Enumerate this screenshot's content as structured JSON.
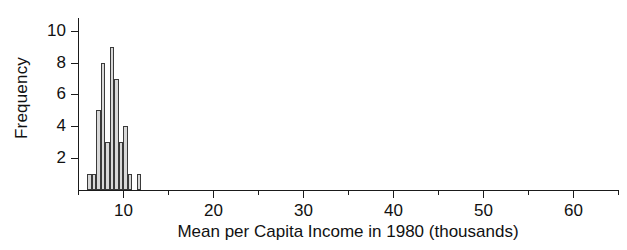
{
  "chart_data": {
    "type": "bar",
    "title": "",
    "xlabel": "Mean per Capita Income in 1980 (thousands)",
    "ylabel": "Frequency",
    "grid": false,
    "legend": null,
    "xlim": [
      5.0,
      65.0
    ],
    "ylim": [
      0,
      10.8
    ],
    "bin_width": 0.5,
    "x_major_ticks": [
      10,
      20,
      30,
      40,
      50,
      60
    ],
    "x_major_tick_labels": [
      "10",
      "20",
      "30",
      "40",
      "50",
      "60"
    ],
    "x_minor_ticks": [
      5,
      15,
      25,
      35,
      45,
      55,
      65
    ],
    "y_ticks": [
      2,
      4,
      6,
      8,
      10
    ],
    "y_tick_labels": [
      "2",
      "4",
      "6",
      "8",
      "10"
    ],
    "bins": [
      {
        "left": 6.0,
        "right": 6.5,
        "value": 1
      },
      {
        "left": 6.5,
        "right": 7.0,
        "value": 1
      },
      {
        "left": 7.0,
        "right": 7.5,
        "value": 5
      },
      {
        "left": 7.5,
        "right": 8.0,
        "value": 8
      },
      {
        "left": 8.0,
        "right": 8.5,
        "value": 3
      },
      {
        "left": 8.5,
        "right": 9.0,
        "value": 9
      },
      {
        "left": 9.0,
        "right": 9.5,
        "value": 7
      },
      {
        "left": 9.5,
        "right": 10.0,
        "value": 3
      },
      {
        "left": 10.0,
        "right": 10.5,
        "value": 4
      },
      {
        "left": 10.5,
        "right": 11.0,
        "value": 1
      },
      {
        "left": 11.0,
        "right": 11.5,
        "value": 0
      },
      {
        "left": 11.5,
        "right": 12.0,
        "value": 1
      }
    ],
    "categories": [
      "6.0",
      "6.5",
      "7.0",
      "7.5",
      "8.0",
      "8.5",
      "9.0",
      "9.5",
      "10.0",
      "10.5",
      "11.0",
      "11.5"
    ],
    "values": [
      1,
      1,
      5,
      8,
      3,
      9,
      7,
      3,
      4,
      1,
      0,
      1
    ],
    "colors": {
      "bar_fill": "#d8d8d8",
      "bar_edge": "#3a3a3a",
      "axis": "#1a1a1a",
      "background": "#ffffff",
      "text": "#111111"
    }
  }
}
